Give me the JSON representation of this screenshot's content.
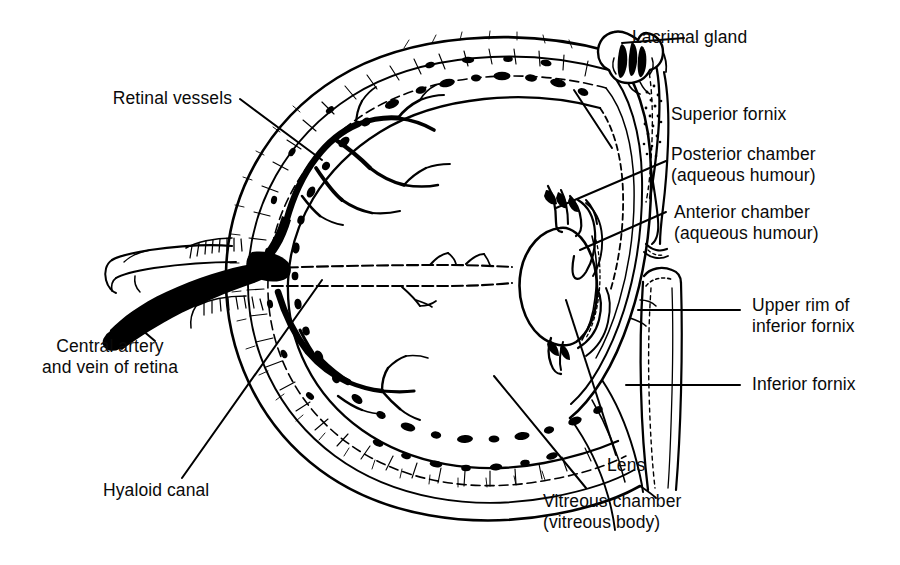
{
  "figure": {
    "background_color": "#ffffff",
    "ink_color": "#000000"
  },
  "labels": {
    "retinal_vessels": "Retinal vessels",
    "central_artery_vein": "Central artery\nand vein of retina",
    "hyaloid_canal": "Hyaloid canal",
    "lacrimal_gland": "Lacrimal gland",
    "superior_fornix": "Superior fornix",
    "posterior_chamber": "Posterior chamber\n(aqueous humour)",
    "anterior_chamber": "Anterior chamber\n(aqueous humour)",
    "upper_rim_inferior_fornix": "Upper rim of\ninferior fornix",
    "inferior_fornix": "Inferior fornix",
    "lens": "Lens",
    "vitreous_chamber": "Vitreous chamber\n(vitreous body)"
  },
  "structures": [
    {
      "name": "sclera",
      "description": "outer fibrous coat drawn as hatched band"
    },
    {
      "name": "choroid",
      "description": "pigmented middle band with dark blotches"
    },
    {
      "name": "retina",
      "description": "inner coat line"
    },
    {
      "name": "optic-nerve",
      "description": "stump at posterior pole, left side"
    },
    {
      "name": "central-retinal-vessels",
      "description": "solid black trunk entering optic disc and branching over retina"
    },
    {
      "name": "hyaloid-canal",
      "description": "pair of dashed horizontal lines from optic disc to lens"
    },
    {
      "name": "lens",
      "description": "biconvex oval at anterior pole"
    },
    {
      "name": "ciliary-body",
      "description": "wedge structures above and below lens"
    },
    {
      "name": "cornea",
      "description": "anterior transparent dome"
    },
    {
      "name": "conjunctiva",
      "description": "membrane reflecting into superior and inferior fornices"
    },
    {
      "name": "eyelid-upper",
      "description": "upper lid above superior fornix"
    },
    {
      "name": "eyelid-lower",
      "description": "lower lid band at right"
    },
    {
      "name": "lacrimal-gland",
      "description": "lobulated gland above upper lid"
    }
  ]
}
